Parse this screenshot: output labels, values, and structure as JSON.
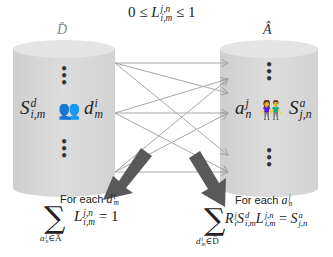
{
  "diagram": {
    "left_set": {
      "title": "D̂",
      "node_symbol": "S",
      "node_sup": "d",
      "node_sub": "i,m",
      "item_symbol": "d",
      "item_sup": "i",
      "item_sub": "m",
      "ellipsis": "⋮",
      "icon": "people-group-icon"
    },
    "right_set": {
      "title": "Â",
      "node_symbol": "S",
      "node_sup": "a",
      "node_sub": "j,n",
      "item_symbol": "a",
      "item_sup": "j",
      "item_sub": "n",
      "ellipsis": "⋮",
      "icon": "people-pair-icon"
    },
    "link_constraint": {
      "left": "0 ≤ ",
      "symbol": "L",
      "sup": "j,n",
      "sub": "i,m",
      "right": " ≤ 1"
    },
    "constraint_left": {
      "caption": "For each ",
      "caption_symbol": "d",
      "caption_sup": "i",
      "caption_sub": "m",
      "sum": "∑",
      "sum_under": "aⁿʲ∈Â",
      "sum_under_symbol": "a",
      "sum_under_sup": "j",
      "sum_under_sub": "n",
      "sum_under_rest": "∈Â",
      "term_symbol": "L",
      "term_sup": "j,n",
      "term_sub": "i,m",
      "rhs": " = 1"
    },
    "constraint_right": {
      "caption": "For each ",
      "caption_symbol": "a",
      "caption_sup": "j",
      "caption_sub": "n",
      "sum": "∑",
      "sum_under_symbol": "d",
      "sum_under_sup": "i",
      "sum_under_sub": "m",
      "sum_under_rest": "∈D̂",
      "t1_symbol": "R",
      "t1_sup": "j",
      "t1_sub": "i",
      "t2_symbol": "S",
      "t2_sup": "d",
      "t2_sub": "i,m",
      "t3_symbol": "L",
      "t3_sup": "j,n",
      "t3_sub": "i,m",
      "equals": " = ",
      "rhs_symbol": "S",
      "rhs_sup": "a",
      "rhs_sub": "j,n"
    },
    "colors": {
      "cylinder_body": "#d9d9d9",
      "cylinder_top": "#e6e6e6",
      "link_line": "#a8a8a8",
      "thick_arrow": "#595959"
    }
  }
}
